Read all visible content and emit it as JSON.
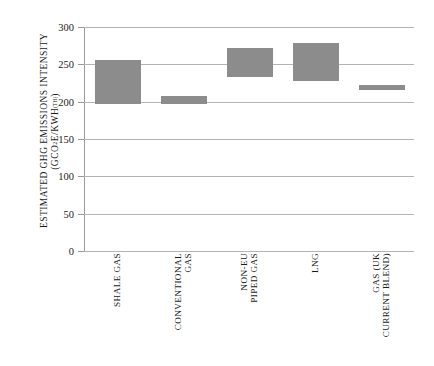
{
  "chart_data": {
    "type": "bar",
    "bar_style": "floating-range",
    "title": "",
    "subtitle": "",
    "xlabel": "",
    "ylabel": "ESTIMATED GHG EMISSIONS INTENSITY",
    "ylabel_unit": "(GCO2E/KWH(TH))",
    "ylabel_unit_parts": {
      "prefix": "(GCO",
      "sub1": "2",
      "mid": "E/KWH",
      "sub2": "(TH)",
      "suffix": ")"
    },
    "ylim": [
      0,
      300
    ],
    "yticks": [
      0,
      50,
      100,
      150,
      200,
      250,
      300
    ],
    "ytick_labels": [
      "0",
      "50",
      "100",
      "150",
      "200",
      "250",
      "300"
    ],
    "grid": true,
    "grid_axis": "y",
    "legend": false,
    "legend_position": "none",
    "categories": [
      "SHALE GAS",
      "CONVENTIONAL GAS",
      "NON-EU PIPED GAS",
      "LNG",
      "GAS (UK CURRENT BLEND)"
    ],
    "category_label_lines": [
      [
        "SHALE GAS"
      ],
      [
        "CONVENTIONAL",
        "GAS"
      ],
      [
        "NON-EU",
        "PIPED GAS"
      ],
      [
        "LNG"
      ],
      [
        "GAS (UK",
        "CURRENT BLEND)"
      ]
    ],
    "series": [
      {
        "name": "low",
        "values": [
          200,
          200,
          236,
          230,
          219
        ]
      },
      {
        "name": "high",
        "values": [
          256,
          207,
          272,
          278,
          223
        ]
      }
    ],
    "ranges": [
      {
        "category": "SHALE GAS",
        "low": 200,
        "high": 256
      },
      {
        "category": "CONVENTIONAL GAS",
        "low": 200,
        "high": 207
      },
      {
        "category": "NON-EU PIPED GAS",
        "low": 236,
        "high": 272
      },
      {
        "category": "LNG",
        "low": 230,
        "high": 278
      },
      {
        "category": "GAS (UK CURRENT BLEND)",
        "low": 219,
        "high": 223
      }
    ]
  },
  "style": {
    "bar_color": "#8c8c8c",
    "grid_color": "#b4b4b4",
    "axis_color": "#9a9a9a",
    "text_color": "#1a1a1a",
    "background": "#ffffff"
  }
}
